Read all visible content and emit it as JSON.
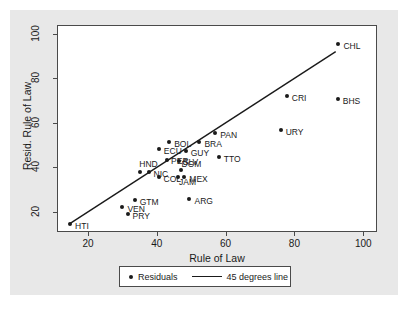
{
  "chart_data": {
    "type": "scatter",
    "title": "",
    "xlabel": "Rule of Law",
    "ylabel": "Resid. Rule of Law",
    "xlim": [
      11,
      104
    ],
    "ylim": [
      11,
      104
    ],
    "xticks": [
      20,
      40,
      60,
      80,
      100
    ],
    "yticks": [
      20,
      40,
      60,
      80,
      100
    ],
    "grid": false,
    "legend_position": "below-plot",
    "legend": [
      {
        "label": "Residuals",
        "marker": "dot"
      },
      {
        "label": "45 degrees line",
        "marker": "line"
      }
    ],
    "reference_line": {
      "label": "45 degrees line",
      "type": "identity",
      "x_start": 14.5,
      "y_start": 14.5,
      "x_end": 92.0,
      "y_end": 92.0
    },
    "points": [
      {
        "label": "HTI",
        "x": 14.8,
        "y": 14.6,
        "label_dx": 5,
        "label_dy": 3
      },
      {
        "label": "PRY",
        "x": 31.5,
        "y": 19.0,
        "label_dx": 5,
        "label_dy": 3
      },
      {
        "label": "VEN",
        "x": 30.0,
        "y": 22.3,
        "label_dx": 5,
        "label_dy": 3
      },
      {
        "label": "GTM",
        "x": 33.6,
        "y": 25.6,
        "label_dx": 5,
        "label_dy": 3
      },
      {
        "label": "ARG",
        "x": 49.5,
        "y": 25.8,
        "label_dx": 5,
        "label_dy": 3
      },
      {
        "label": "COL",
        "x": 40.5,
        "y": 35.5,
        "label_dx": 5,
        "label_dy": 3
      },
      {
        "label": "NIC",
        "x": 37.6,
        "y": 37.8,
        "label_dx": 5,
        "label_dy": 3
      },
      {
        "label": "HND",
        "x": 35.2,
        "y": 37.8,
        "label_dx": -1,
        "label_dy": -7
      },
      {
        "label": "JAM",
        "x": 46.2,
        "y": 35.9,
        "label_dx": 1,
        "label_dy": 6
      },
      {
        "label": "MEX",
        "x": 48.0,
        "y": 35.9,
        "label_dx": 5,
        "label_dy": 3
      },
      {
        "label": "DOM",
        "x": 46.9,
        "y": 38.8,
        "label_dx": 1,
        "label_dy": -5
      },
      {
        "label": "SLV",
        "x": 46.4,
        "y": 43.0,
        "label_dx": 4,
        "label_dy": 2
      },
      {
        "label": "PER",
        "x": 43.0,
        "y": 43.5,
        "label_dx": 4,
        "label_dy": 2
      },
      {
        "label": "GUY",
        "x": 48.4,
        "y": 47.5,
        "label_dx": 5,
        "label_dy": 3
      },
      {
        "label": "ECU",
        "x": 40.6,
        "y": 48.3,
        "label_dx": 5,
        "label_dy": 3
      },
      {
        "label": "BOL",
        "x": 43.6,
        "y": 51.3,
        "label_dx": 5,
        "label_dy": 3
      },
      {
        "label": "BRA",
        "x": 52.4,
        "y": 51.3,
        "label_dx": 5,
        "label_dy": 3
      },
      {
        "label": "TTO",
        "x": 58.0,
        "y": 44.7,
        "label_dx": 5,
        "label_dy": 3
      },
      {
        "label": "PAN",
        "x": 57.0,
        "y": 55.5,
        "label_dx": 5,
        "label_dy": 3
      },
      {
        "label": "URY",
        "x": 76.0,
        "y": 56.9,
        "label_dx": 5,
        "label_dy": 3
      },
      {
        "label": "BHS",
        "x": 92.6,
        "y": 70.7,
        "label_dx": 5,
        "label_dy": 3
      },
      {
        "label": "CRI",
        "x": 77.8,
        "y": 72.0,
        "label_dx": 5,
        "label_dy": 3
      },
      {
        "label": "CHL",
        "x": 92.8,
        "y": 95.4,
        "label_dx": 5,
        "label_dy": 3
      }
    ]
  }
}
